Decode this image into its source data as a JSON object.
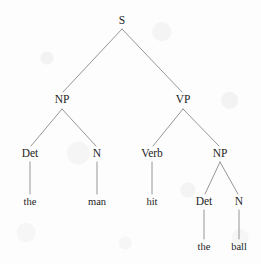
{
  "figure": {
    "kind": "constituency-parse-tree",
    "sentence": "the man hit the ball",
    "background_color": "#fdfdfd",
    "edge_color": "#8a8a8a",
    "text_color": "#1d1d1d"
  },
  "nodes": [
    {
      "id": "S",
      "label": "S",
      "type": "nonterminal",
      "x": 122,
      "y": 21
    },
    {
      "id": "NP1",
      "label": "NP",
      "type": "nonterminal",
      "x": 62,
      "y": 100
    },
    {
      "id": "VP",
      "label": "VP",
      "type": "nonterminal",
      "x": 183,
      "y": 100
    },
    {
      "id": "Det1",
      "label": "Det",
      "type": "nonterminal",
      "x": 30,
      "y": 154
    },
    {
      "id": "N1",
      "label": "N",
      "type": "nonterminal",
      "x": 97,
      "y": 154
    },
    {
      "id": "Verb",
      "label": "Verb",
      "type": "nonterminal",
      "x": 152,
      "y": 154
    },
    {
      "id": "NP2",
      "label": "NP",
      "type": "nonterminal",
      "x": 220,
      "y": 154
    },
    {
      "id": "the1",
      "label": "the",
      "type": "terminal",
      "x": 30,
      "y": 202
    },
    {
      "id": "man",
      "label": "man",
      "type": "terminal",
      "x": 97,
      "y": 202
    },
    {
      "id": "hit",
      "label": "hit",
      "type": "terminal",
      "x": 152,
      "y": 202
    },
    {
      "id": "Det2",
      "label": "Det",
      "type": "nonterminal",
      "x": 204,
      "y": 202
    },
    {
      "id": "N2",
      "label": "N",
      "type": "nonterminal",
      "x": 239,
      "y": 202
    },
    {
      "id": "the2",
      "label": "the",
      "type": "terminal",
      "x": 204,
      "y": 247
    },
    {
      "id": "ball",
      "label": "ball",
      "type": "terminal",
      "x": 239,
      "y": 247
    }
  ],
  "edges": [
    {
      "from": "S",
      "to": "NP1",
      "x1": 122,
      "y1": 29,
      "x2": 63,
      "y2": 92
    },
    {
      "from": "S",
      "to": "VP",
      "x1": 122,
      "y1": 29,
      "x2": 182,
      "y2": 92
    },
    {
      "from": "NP1",
      "to": "Det1",
      "x1": 62,
      "y1": 109,
      "x2": 31,
      "y2": 146
    },
    {
      "from": "NP1",
      "to": "N1",
      "x1": 62,
      "y1": 109,
      "x2": 96,
      "y2": 146
    },
    {
      "from": "VP",
      "to": "Verb",
      "x1": 183,
      "y1": 109,
      "x2": 153,
      "y2": 146
    },
    {
      "from": "VP",
      "to": "NP2",
      "x1": 183,
      "y1": 109,
      "x2": 219,
      "y2": 146
    },
    {
      "from": "Det1",
      "to": "the1",
      "x1": 30,
      "y1": 162,
      "x2": 30,
      "y2": 194
    },
    {
      "from": "N1",
      "to": "man",
      "x1": 97,
      "y1": 162,
      "x2": 97,
      "y2": 194
    },
    {
      "from": "Verb",
      "to": "hit",
      "x1": 152,
      "y1": 162,
      "x2": 152,
      "y2": 194
    },
    {
      "from": "NP2",
      "to": "Det2",
      "x1": 220,
      "y1": 162,
      "x2": 205,
      "y2": 194
    },
    {
      "from": "NP2",
      "to": "N2",
      "x1": 220,
      "y1": 162,
      "x2": 238,
      "y2": 194
    },
    {
      "from": "Det2",
      "to": "the2",
      "x1": 204,
      "y1": 210,
      "x2": 204,
      "y2": 239
    },
    {
      "from": "N2",
      "to": "ball",
      "x1": 239,
      "y1": 210,
      "x2": 239,
      "y2": 239
    }
  ]
}
